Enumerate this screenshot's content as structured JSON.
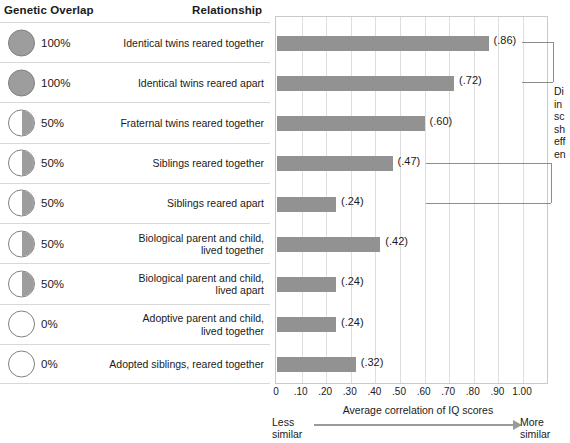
{
  "headers": {
    "genetic_overlap": "Genetic Overlap",
    "relationship": "Relationship"
  },
  "rows": [
    {
      "percent": "100%",
      "fill": "full",
      "label": "Identical twins reared together",
      "value": "(.86)",
      "v": 0.86
    },
    {
      "percent": "100%",
      "fill": "full",
      "label": "Identical twins reared apart",
      "value": "(.72)",
      "v": 0.72
    },
    {
      "percent": "50%",
      "fill": "half",
      "label": "Fraternal twins reared together",
      "value": "(.60)",
      "v": 0.6
    },
    {
      "percent": "50%",
      "fill": "half",
      "label": "Siblings reared together",
      "value": "(.47)",
      "v": 0.47
    },
    {
      "percent": "50%",
      "fill": "half",
      "label": "Siblings reared apart",
      "value": "(.24)",
      "v": 0.24
    },
    {
      "percent": "50%",
      "fill": "half",
      "label": "Biological parent and child,\nlived together",
      "value": "(.42)",
      "v": 0.42
    },
    {
      "percent": "50%",
      "fill": "half",
      "label": "Biological parent and child,\nlived apart",
      "value": "(.24)",
      "v": 0.24
    },
    {
      "percent": "0%",
      "fill": "empty",
      "label": "Adoptive parent and child,\nlived together",
      "value": "(.24)",
      "v": 0.24
    },
    {
      "percent": "0%",
      "fill": "empty",
      "label": "Adopted siblings, reared together",
      "value": "(.32)",
      "v": 0.32
    }
  ],
  "axis": {
    "ticks": [
      "0",
      ".10",
      ".20",
      ".30",
      ".40",
      ".50",
      ".60",
      ".70",
      ".80",
      ".90",
      "1.00"
    ],
    "title": "Average correlation of IQ scores",
    "less_similar": "Less\nsimilar",
    "more_similar": "More\nsimilar"
  },
  "annotation": {
    "text": "Di\nin\nsc\nsh\neff\nen"
  },
  "colors": {
    "bar": "#929292",
    "circle_fill": "#9d9d9d",
    "grid": "#dedede",
    "plot_border": "#c9c9c9",
    "row_divider": "#d8d8d8",
    "text": "#1a1a1a",
    "arrow": "#9a9a9a"
  },
  "chart_data": {
    "type": "bar",
    "orientation": "horizontal",
    "title": "",
    "xlabel": "Average correlation of IQ scores",
    "ylabel": "Relationship",
    "xlim": [
      0,
      1.0
    ],
    "grid": true,
    "legend": "none",
    "categories": [
      "Identical twins reared together",
      "Identical twins reared apart",
      "Fraternal twins reared together",
      "Siblings reared together",
      "Siblings reared apart",
      "Biological parent and child, lived together",
      "Biological parent and child, lived apart",
      "Adoptive parent and child, lived together",
      "Adopted siblings, reared together"
    ],
    "values": [
      0.86,
      0.72,
      0.6,
      0.47,
      0.24,
      0.42,
      0.24,
      0.24,
      0.32
    ],
    "data_labels": [
      "(.86)",
      "(.72)",
      "(.60)",
      "(.47)",
      "(.24)",
      "(.42)",
      "(.24)",
      "(.24)",
      "(.32)"
    ],
    "genetic_overlap": [
      "100%",
      "100%",
      "50%",
      "50%",
      "50%",
      "50%",
      "50%",
      "0%",
      "0%"
    ],
    "xticks": [
      0,
      0.1,
      0.2,
      0.3,
      0.4,
      0.5,
      0.6,
      0.7,
      0.8,
      0.9,
      1.0
    ],
    "xticklabels": [
      "0",
      ".10",
      ".20",
      ".30",
      ".40",
      ".50",
      ".60",
      ".70",
      ".80",
      ".90",
      "1.00"
    ],
    "annotations": [
      {
        "text": "Less similar",
        "position": "axis-left-end"
      },
      {
        "text": "More similar",
        "position": "axis-right-end"
      }
    ],
    "brackets": [
      {
        "rows": [
          0,
          1
        ],
        "note": "connects (.86) and (.72)"
      },
      {
        "rows": [
          3,
          4
        ],
        "note": "connects (.47) and (.24)"
      }
    ]
  }
}
